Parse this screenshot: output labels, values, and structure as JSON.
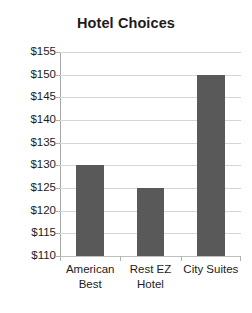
{
  "chart_data": {
    "type": "bar",
    "title": "Hotel Choices",
    "xlabel": "",
    "ylabel": "",
    "categories": [
      "American Best",
      "Rest EZ Hotel",
      "City Suites"
    ],
    "category_lines": [
      [
        "American",
        "Best"
      ],
      [
        "Rest EZ",
        "Hotel"
      ],
      [
        "City Suites"
      ]
    ],
    "values": [
      130,
      125,
      150
    ],
    "value_prefix": "$",
    "ylim": [
      110,
      155
    ],
    "ytick_step": 5,
    "ytick_labels": [
      "$155",
      "$150",
      "$145",
      "$140",
      "$135",
      "$130",
      "$125",
      "$120",
      "$115",
      "$110"
    ],
    "ytick_values": [
      155,
      150,
      145,
      140,
      135,
      130,
      125,
      120,
      115,
      110
    ],
    "grid": true,
    "legend": false,
    "legend_position": "none",
    "colors": {
      "bar_fill": "#595959",
      "gridline": "#d6d6d6",
      "axis_line": "#a6a6a6",
      "text": "#1c1c1c",
      "background": "#ffffff"
    }
  }
}
